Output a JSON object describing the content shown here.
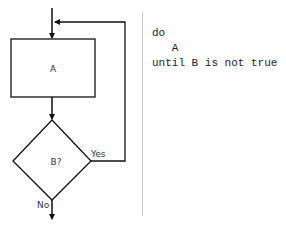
{
  "diagram": {
    "process": {
      "label": "A"
    },
    "decision": {
      "label": "B?"
    },
    "branches": {
      "yes": "Yes",
      "no": "No"
    },
    "colors": {
      "stroke": "#111111",
      "text": "#333333",
      "divider": "#c8c8c8"
    }
  },
  "code": {
    "lines": [
      "do",
      "   A",
      "until B is not true"
    ]
  }
}
